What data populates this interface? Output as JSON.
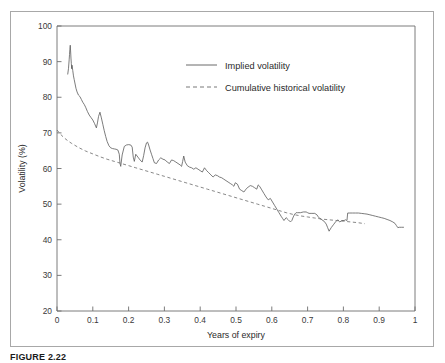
{
  "figure": {
    "caption": "FIGURE 2.22",
    "background_color": "#ffffff",
    "frame_color": "#a8a8a8"
  },
  "chart_data": {
    "type": "line",
    "title": "",
    "subtitle": "",
    "xlabel": "Years of expiry",
    "ylabel": "Volatility (%)",
    "xlim": [
      0,
      1
    ],
    "ylim": [
      20,
      100
    ],
    "xticks": [
      0,
      0.1,
      0.2,
      0.3,
      0.4,
      0.5,
      0.6,
      0.7,
      0.8,
      0.9,
      1
    ],
    "xticklabels": [
      "0",
      "0.1",
      "0.2",
      "0.3",
      "0.4",
      "0.5",
      "0.6",
      "0.7",
      "0.8",
      "0.9",
      "1"
    ],
    "yticks": [
      20,
      30,
      40,
      50,
      60,
      70,
      80,
      90,
      100
    ],
    "yticklabels": [
      "20",
      "30",
      "40",
      "50",
      "60",
      "70",
      "80",
      "90",
      "100"
    ],
    "grid": false,
    "legend_position": "upper-center-right",
    "legend": [
      "Implied volatility",
      "Cumulative historical volatility"
    ],
    "series": [
      {
        "name": "Implied volatility",
        "style": "solid",
        "color": "#5a5a5a",
        "x": [
          0.03,
          0.032,
          0.034,
          0.035,
          0.036,
          0.037,
          0.038,
          0.039,
          0.04,
          0.041,
          0.042,
          0.044,
          0.046,
          0.048,
          0.05,
          0.053,
          0.056,
          0.06,
          0.064,
          0.068,
          0.072,
          0.076,
          0.08,
          0.085,
          0.09,
          0.095,
          0.1,
          0.105,
          0.11,
          0.113,
          0.116,
          0.12,
          0.124,
          0.128,
          0.132,
          0.136,
          0.14,
          0.145,
          0.15,
          0.155,
          0.16,
          0.165,
          0.17,
          0.174,
          0.176,
          0.178,
          0.182,
          0.188,
          0.194,
          0.2,
          0.206,
          0.21,
          0.213,
          0.216,
          0.22,
          0.226,
          0.232,
          0.238,
          0.242,
          0.246,
          0.25,
          0.253,
          0.256,
          0.26,
          0.264,
          0.268,
          0.272,
          0.278,
          0.284,
          0.29,
          0.296,
          0.302,
          0.308,
          0.314,
          0.32,
          0.326,
          0.332,
          0.338,
          0.344,
          0.348,
          0.351,
          0.354,
          0.358,
          0.364,
          0.37,
          0.376,
          0.382,
          0.388,
          0.394,
          0.4,
          0.406,
          0.412,
          0.418,
          0.424,
          0.43,
          0.436,
          0.442,
          0.448,
          0.454,
          0.46,
          0.466,
          0.472,
          0.478,
          0.484,
          0.49,
          0.494,
          0.498,
          0.504,
          0.51,
          0.516,
          0.522,
          0.528,
          0.534,
          0.54,
          0.546,
          0.552,
          0.558,
          0.562,
          0.566,
          0.572,
          0.578,
          0.584,
          0.59,
          0.596,
          0.602,
          0.608,
          0.614,
          0.62,
          0.626,
          0.63,
          0.634,
          0.64,
          0.646,
          0.652,
          0.656,
          0.66,
          0.664,
          0.668,
          0.672,
          0.68,
          0.688,
          0.696,
          0.7,
          0.704,
          0.712,
          0.72,
          0.726,
          0.73,
          0.734,
          0.74,
          0.746,
          0.752,
          0.756,
          0.76,
          0.766,
          0.772,
          0.778,
          0.784,
          0.79,
          0.796,
          0.802,
          0.806,
          0.81,
          0.812,
          0.818,
          0.826,
          0.834,
          0.842,
          0.85,
          0.858,
          0.866,
          0.874,
          0.882,
          0.89,
          0.898,
          0.906,
          0.914,
          0.922,
          0.93,
          0.938,
          0.944,
          0.948,
          0.952,
          0.956,
          0.962,
          0.968
        ],
        "y": [
          86.5,
          88.0,
          90.5,
          92.0,
          93.5,
          94.6,
          93.0,
          91.0,
          89.5,
          88.0,
          89.0,
          87.5,
          86.0,
          85.0,
          84.0,
          82.5,
          81.5,
          80.6,
          80.2,
          79.4,
          78.6,
          78.0,
          77.2,
          76.0,
          75.0,
          74.3,
          73.6,
          72.6,
          71.4,
          72.8,
          74.6,
          75.8,
          74.2,
          72.4,
          70.6,
          69.0,
          67.6,
          66.4,
          65.8,
          65.6,
          65.5,
          65.4,
          65.2,
          64.0,
          61.4,
          60.6,
          63.8,
          66.2,
          66.6,
          66.7,
          66.6,
          66.0,
          63.2,
          62.0,
          64.0,
          63.2,
          62.4,
          61.8,
          63.6,
          65.8,
          67.2,
          67.4,
          66.6,
          65.2,
          64.0,
          62.8,
          61.6,
          61.4,
          62.4,
          63.0,
          62.6,
          62.4,
          61.8,
          61.4,
          62.4,
          62.2,
          61.8,
          61.4,
          61.0,
          60.6,
          62.0,
          63.5,
          61.8,
          60.8,
          60.4,
          60.2,
          59.8,
          60.2,
          59.8,
          59.4,
          59.0,
          60.2,
          59.4,
          58.8,
          58.2,
          57.6,
          58.2,
          58.0,
          57.6,
          57.4,
          57.0,
          56.6,
          56.2,
          55.8,
          55.4,
          55.0,
          56.0,
          55.6,
          54.2,
          53.8,
          53.4,
          54.2,
          54.8,
          55.2,
          55.0,
          54.6,
          54.2,
          55.4,
          55.0,
          54.0,
          53.0,
          52.0,
          51.2,
          51.6,
          50.6,
          49.6,
          48.6,
          47.6,
          46.6,
          46.0,
          45.4,
          46.2,
          45.6,
          45.0,
          45.4,
          46.4,
          47.2,
          47.6,
          47.6,
          47.6,
          47.8,
          47.8,
          47.6,
          47.4,
          47.4,
          47.4,
          47.0,
          46.4,
          46.0,
          45.6,
          45.2,
          44.4,
          43.4,
          42.4,
          43.4,
          44.2,
          45.0,
          45.6,
          45.0,
          45.4,
          45.4,
          45.6,
          45.4,
          47.5,
          47.5,
          47.5,
          47.5,
          47.5,
          47.4,
          47.3,
          47.2,
          47.0,
          46.8,
          46.6,
          46.4,
          46.2,
          46.0,
          45.7,
          45.4,
          45.0,
          44.6,
          44.0,
          43.4,
          43.5,
          43.5,
          43.5
        ]
      },
      {
        "name": "Cumulative historical volatility",
        "style": "dashed",
        "color": "#6a6a6a",
        "x": [
          0.0,
          0.01,
          0.02,
          0.03,
          0.04,
          0.05,
          0.06,
          0.07,
          0.08,
          0.09,
          0.1,
          0.12,
          0.14,
          0.16,
          0.18,
          0.2,
          0.22,
          0.24,
          0.26,
          0.28,
          0.3,
          0.32,
          0.34,
          0.36,
          0.38,
          0.4,
          0.42,
          0.44,
          0.46,
          0.48,
          0.5,
          0.52,
          0.54,
          0.56,
          0.58,
          0.6,
          0.62,
          0.64,
          0.66,
          0.68,
          0.7,
          0.72,
          0.74,
          0.76,
          0.78,
          0.8,
          0.82,
          0.84,
          0.86
        ],
        "y": [
          70.8,
          69.6,
          68.6,
          67.8,
          67.1,
          66.5,
          65.9,
          65.4,
          64.9,
          64.5,
          64.1,
          63.3,
          62.6,
          62.0,
          61.4,
          60.8,
          60.2,
          59.6,
          59.0,
          58.4,
          57.8,
          57.2,
          56.6,
          56.0,
          55.4,
          54.8,
          54.2,
          53.6,
          53.0,
          52.4,
          51.8,
          51.2,
          50.6,
          50.0,
          49.4,
          48.8,
          48.2,
          47.6,
          47.1,
          46.7,
          46.4,
          46.1,
          45.8,
          45.6,
          45.4,
          45.2,
          45.0,
          44.8,
          44.5
        ]
      }
    ]
  }
}
